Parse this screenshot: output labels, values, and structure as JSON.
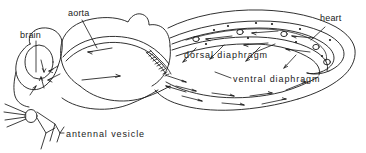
{
  "figure": {
    "background_color": "#ffffff",
    "line_color": "#1a1a1a",
    "labels": {
      "brain": "brain",
      "aorta": "aorta",
      "heart": "heart",
      "dorsal_diaphragm": "dorsal diaphragm",
      "ventral_diaphragm": "ventral diaphragm",
      "antennal_vesicle": "antennal vesicle"
    },
    "structures": [
      "head capsule",
      "brain oval",
      "antennae",
      "mouthparts",
      "antennal vesicle",
      "thorax dome",
      "aorta tube",
      "coiled aorta segment",
      "abdomen",
      "heart tube with ostia",
      "dorsal diaphragm",
      "ventral diaphragm"
    ],
    "flow_arrows": {
      "dorsal_direction": "posterior to anterior (right to left) inside heart and aorta",
      "ventral_direction": "anterior to posterior (left to right) along ventral diaphragm",
      "ostia_count": 6
    }
  }
}
